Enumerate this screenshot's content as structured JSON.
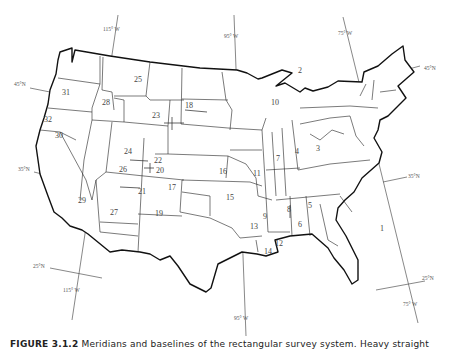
{
  "figure": {
    "caption_label": "FIGURE 3.1.2",
    "caption_text": "Meridians and baselines of the rectangular survey system. Heavy straight"
  },
  "graticule": {
    "meridians": [
      {
        "label": "115° W",
        "top_x": 118,
        "top_y": 28,
        "bottom_label": "115° W"
      },
      {
        "label": "95° W",
        "top_x": 245,
        "top_y": 34,
        "bottom_label": "95° W"
      },
      {
        "label": "75° W",
        "top_x": 343,
        "top_y": 33,
        "bottom_label": "75° W"
      }
    ],
    "parallels": [
      {
        "label": "45°N",
        "side": "left"
      },
      {
        "label": "45°N",
        "side": "right"
      },
      {
        "label": "35°N",
        "side": "left"
      },
      {
        "label": "35°N",
        "side": "right"
      },
      {
        "label": "25°N",
        "side": "left"
      },
      {
        "label": "25°N",
        "side": "right"
      }
    ]
  },
  "principal_meridians": [
    {
      "id": "1",
      "x": 382,
      "y": 228
    },
    {
      "id": "2",
      "x": 250,
      "y": 105
    },
    {
      "id": "3",
      "x": 316,
      "y": 150
    },
    {
      "id": "4",
      "x": 296,
      "y": 152
    },
    {
      "id": "5",
      "x": 309,
      "y": 205
    },
    {
      "id": "6",
      "x": 299,
      "y": 221
    },
    {
      "id": "7",
      "x": 277,
      "y": 158
    },
    {
      "id": "8",
      "x": 287,
      "y": 209
    },
    {
      "id": "9",
      "x": 264,
      "y": 217
    },
    {
      "id": "10",
      "x": 267,
      "y": 100
    },
    {
      "id": "11",
      "x": 255,
      "y": 174
    },
    {
      "id": "12",
      "x": 277,
      "y": 242
    },
    {
      "id": "13",
      "x": 250,
      "y": 225
    },
    {
      "id": "14",
      "x": 265,
      "y": 252
    },
    {
      "id": "15",
      "x": 227,
      "y": 196
    },
    {
      "id": "16",
      "x": 219,
      "y": 172
    },
    {
      "id": "17",
      "x": 153,
      "y": 186
    },
    {
      "id": "18",
      "x": 184,
      "y": 107
    },
    {
      "id": "19",
      "x": 163,
      "y": 214
    },
    {
      "id": "20",
      "x": 158,
      "y": 170
    },
    {
      "id": "21",
      "x": 141,
      "y": 193
    },
    {
      "id": "22",
      "x": 151,
      "y": 160
    },
    {
      "id": "23",
      "x": 207,
      "y": 115
    },
    {
      "id": "24",
      "x": 125,
      "y": 150
    },
    {
      "id": "25",
      "x": 136,
      "y": 80
    },
    {
      "id": "26",
      "x": 119,
      "y": 169
    },
    {
      "id": "27",
      "x": 110,
      "y": 212
    },
    {
      "id": "28",
      "x": 103,
      "y": 103
    },
    {
      "id": "29",
      "x": 80,
      "y": 200
    },
    {
      "id": "30",
      "x": 56,
      "y": 134
    },
    {
      "id": "31",
      "x": 63,
      "y": 92
    },
    {
      "id": "32",
      "x": 46,
      "y": 120
    }
  ]
}
